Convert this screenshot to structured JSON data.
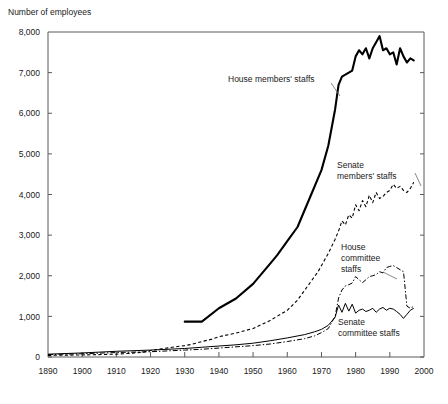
{
  "chart_data": {
    "type": "line",
    "title": "Number of employees",
    "xlabel": "",
    "ylabel": "Number of employees",
    "xlim": [
      1890,
      2000
    ],
    "ylim": [
      0,
      8000
    ],
    "grid": false,
    "legend_position": "inline-annotations",
    "x_ticks": [
      "1890",
      "1900",
      "1910",
      "1920",
      "1930",
      "1940",
      "1950",
      "1960",
      "1970",
      "1980",
      "1990",
      "2000"
    ],
    "y_ticks": [
      "0",
      "1,000",
      "2,000",
      "3,000",
      "4,000",
      "5,000",
      "6,000",
      "7,000",
      "8,000"
    ],
    "series": [
      {
        "name": "House members' staffs",
        "style": "thick-solid",
        "label_text": "House members' staffs",
        "x": [
          1930,
          1935,
          1940,
          1945,
          1950,
          1955,
          1957,
          1960,
          1963,
          1965,
          1967,
          1970,
          1972,
          1974,
          1975,
          1976,
          1977,
          1978,
          1979,
          1980,
          1981,
          1982,
          1983,
          1984,
          1985,
          1986,
          1987,
          1988,
          1989,
          1990,
          1991,
          1992,
          1993,
          1994,
          1995,
          1996,
          1997
        ],
        "values": [
          870,
          870,
          1200,
          1440,
          1800,
          2300,
          2500,
          2850,
          3200,
          3600,
          4000,
          4600,
          5200,
          6100,
          6700,
          6900,
          6950,
          7000,
          7050,
          7400,
          7550,
          7450,
          7600,
          7350,
          7600,
          7750,
          7900,
          7550,
          7600,
          7450,
          7500,
          7200,
          7600,
          7400,
          7250,
          7350,
          7300
        ]
      },
      {
        "name": "Senate members' staffs",
        "style": "dashed",
        "label_text": "Senate members' staffs",
        "x": [
          1890,
          1900,
          1910,
          1914,
          1918,
          1920,
          1924,
          1928,
          1930,
          1932,
          1935,
          1938,
          1940,
          1945,
          1950,
          1955,
          1960,
          1963,
          1966,
          1969,
          1972,
          1974,
          1975,
          1976,
          1977,
          1978,
          1979,
          1980,
          1981,
          1982,
          1983,
          1984,
          1985,
          1986,
          1987,
          1988,
          1989,
          1990,
          1991,
          1992,
          1993,
          1994,
          1995,
          1996,
          1997
        ],
        "values": [
          40,
          50,
          70,
          90,
          120,
          160,
          210,
          260,
          280,
          310,
          380,
          440,
          500,
          590,
          700,
          900,
          1150,
          1400,
          1750,
          2100,
          2550,
          2900,
          3100,
          3350,
          3250,
          3500,
          3420,
          3750,
          3600,
          3850,
          3700,
          3980,
          3800,
          4050,
          3900,
          3950,
          4050,
          4100,
          4250,
          4150,
          4200,
          4100,
          4050,
          4150,
          4300
        ]
      },
      {
        "name": "House committee staffs",
        "style": "dash-dot",
        "label_text": "House committee staffs",
        "x": [
          1890,
          1900,
          1910,
          1920,
          1930,
          1935,
          1940,
          1945,
          1950,
          1955,
          1960,
          1965,
          1968,
          1970,
          1972,
          1974,
          1975,
          1976,
          1977,
          1978,
          1979,
          1980,
          1981,
          1982,
          1983,
          1984,
          1985,
          1986,
          1987,
          1988,
          1989,
          1990,
          1991,
          1992,
          1993,
          1994,
          1995,
          1996,
          1997
        ],
        "values": [
          60,
          80,
          110,
          130,
          170,
          190,
          220,
          250,
          280,
          320,
          380,
          450,
          520,
          600,
          700,
          1000,
          1450,
          1650,
          1750,
          1780,
          1820,
          1980,
          1900,
          1830,
          1900,
          1980,
          2000,
          2030,
          2100,
          2070,
          2200,
          2230,
          2250,
          2200,
          2150,
          2100,
          1250,
          1200,
          1250
        ]
      },
      {
        "name": "Senate committee staffs",
        "style": "thin-solid",
        "label_text": "Senate committee staffs",
        "x": [
          1890,
          1900,
          1910,
          1920,
          1930,
          1935,
          1940,
          1945,
          1950,
          1955,
          1960,
          1965,
          1968,
          1970,
          1972,
          1974,
          1975,
          1976,
          1977,
          1978,
          1979,
          1980,
          1981,
          1982,
          1983,
          1984,
          1985,
          1986,
          1987,
          1988,
          1989,
          1990,
          1991,
          1992,
          1993,
          1994,
          1995,
          1996,
          1997
        ],
        "values": [
          70,
          100,
          140,
          170,
          210,
          240,
          270,
          300,
          340,
          400,
          470,
          550,
          620,
          680,
          780,
          980,
          1280,
          1100,
          1320,
          1130,
          1300,
          1080,
          1150,
          1180,
          1120,
          1150,
          1200,
          1100,
          1180,
          1220,
          1150,
          1200,
          1180,
          1120,
          1050,
          950,
          1050,
          1150,
          1200
        ]
      }
    ],
    "annotations": [
      {
        "text": "House members' staffs",
        "x_px": 228,
        "y_px": 80
      },
      {
        "text_line1": "Senate",
        "text_line2": "members' staffs",
        "x_px": 337,
        "y_px": 166
      },
      {
        "text_line1": "House",
        "text_line2": "committee",
        "text_line3": "staffs",
        "x_px": 341,
        "y_px": 248
      },
      {
        "text_line1": "Senate",
        "text_line2": "committee staffs",
        "x_px": 338,
        "y_px": 323
      }
    ]
  },
  "labels": {
    "y_axis_title": "Number of employees",
    "house_members": "House members' staffs",
    "senate_members_l1": "Senate",
    "senate_members_l2": "members' staffs",
    "house_committee_l1": "House",
    "house_committee_l2": "committee",
    "house_committee_l3": "staffs",
    "senate_committee_l1": "Senate",
    "senate_committee_l2": "committee staffs"
  },
  "y_ticks": [
    {
      "label": "8,000",
      "value": 8000
    },
    {
      "label": "7,000",
      "value": 7000
    },
    {
      "label": "6,000",
      "value": 6000
    },
    {
      "label": "5,000",
      "value": 5000
    },
    {
      "label": "4,000",
      "value": 4000
    },
    {
      "label": "3,000",
      "value": 3000
    },
    {
      "label": "2,000",
      "value": 2000
    },
    {
      "label": "1,000",
      "value": 1000
    },
    {
      "label": "0",
      "value": 0
    }
  ],
  "x_ticks": [
    {
      "label": "1890",
      "value": 1890
    },
    {
      "label": "1900",
      "value": 1900
    },
    {
      "label": "1910",
      "value": 1910
    },
    {
      "label": "1920",
      "value": 1920
    },
    {
      "label": "1930",
      "value": 1930
    },
    {
      "label": "1940",
      "value": 1940
    },
    {
      "label": "1950",
      "value": 1950
    },
    {
      "label": "1960",
      "value": 1960
    },
    {
      "label": "1970",
      "value": 1970
    },
    {
      "label": "1980",
      "value": 1980
    },
    {
      "label": "1990",
      "value": 1990
    },
    {
      "label": "2000",
      "value": 2000
    }
  ],
  "colors": {
    "line": "#000000",
    "axis": "#5a5a5a",
    "text": "#1a1a1a",
    "background": "#ffffff"
  }
}
